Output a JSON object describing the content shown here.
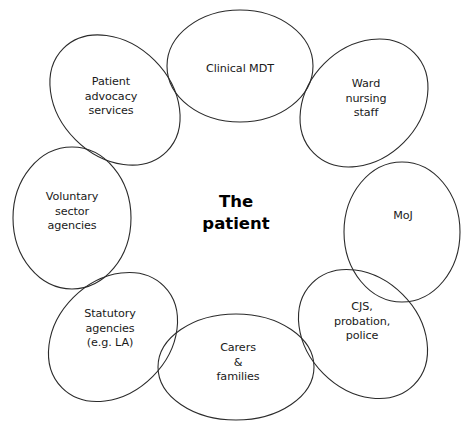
{
  "diagram": {
    "type": "venn-ring",
    "title": "",
    "center": {
      "label": "The\npatient",
      "x": 236,
      "y": 213,
      "bold": true
    },
    "stroke_color": "#2b2b2b",
    "background_color": "#ffffff",
    "text_color": "#1a1a1a",
    "nodes": [
      {
        "id": "clinical-mdt",
        "label": "Clinical MDT",
        "cx": 240,
        "cy": 66,
        "rx": 73,
        "ry": 56,
        "rotation": 0,
        "label_x": 240,
        "label_y": 69
      },
      {
        "id": "ward-nursing-staff",
        "label": "Ward\nnursing\nstaff",
        "cx": 364,
        "cy": 103,
        "rx": 71,
        "ry": 56,
        "rotation": -45,
        "label_x": 366,
        "label_y": 99
      },
      {
        "id": "moj",
        "label": "MoJ",
        "cx": 402,
        "cy": 232,
        "rx": 58,
        "ry": 70,
        "rotation": 0,
        "label_x": 403,
        "label_y": 216
      },
      {
        "id": "cjs-probation-police",
        "label": "CJS,\nprobation,\npolice",
        "cx": 363,
        "cy": 334,
        "rx": 72,
        "ry": 56,
        "rotation": 45,
        "label_x": 362,
        "label_y": 322
      },
      {
        "id": "carers-and-families",
        "label": "Carers\n&\nfamilies",
        "cx": 236,
        "cy": 367,
        "rx": 78,
        "ry": 53,
        "rotation": 0,
        "label_x": 238,
        "label_y": 363
      },
      {
        "id": "statutory-agencies",
        "label": "Statutory\nagencies\n(e.g. LA)",
        "cx": 113,
        "cy": 337,
        "rx": 72,
        "ry": 56,
        "rotation": -45,
        "label_x": 110,
        "label_y": 329
      },
      {
        "id": "voluntary-sector-agencies",
        "label": "Voluntary\nsector\nagencies",
        "cx": 72,
        "cy": 218,
        "rx": 59,
        "ry": 71,
        "rotation": 0,
        "label_x": 72,
        "label_y": 212
      },
      {
        "id": "patient-advocacy-services",
        "label": "Patient\nadvocacy\nservices",
        "cx": 115,
        "cy": 100,
        "rx": 73,
        "ry": 56,
        "rotation": 45,
        "label_x": 111,
        "label_y": 97
      }
    ]
  }
}
